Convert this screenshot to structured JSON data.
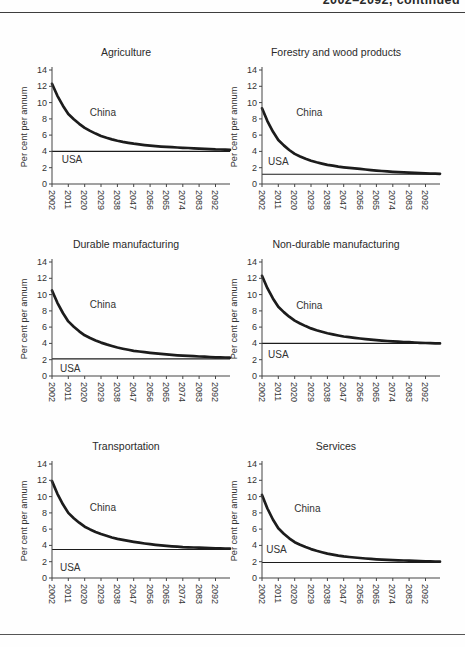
{
  "page": {
    "cropped_caption": "2002–2092, continued",
    "background": "#fefefe",
    "ink": "#1c1c1c",
    "text_color": "#333333",
    "rule_color": "#3e3e3e"
  },
  "axis": {
    "ylabel": "Per cent per annum",
    "y_ticks": [
      0,
      2,
      4,
      6,
      8,
      10,
      12,
      14
    ],
    "x_ticks": [
      2002,
      2011,
      2020,
      2029,
      2038,
      2047,
      2056,
      2065,
      2074,
      2083,
      2092
    ],
    "x_range": [
      2002,
      2100
    ],
    "y_range": [
      0,
      14
    ],
    "grid": false,
    "legend": "in-plot text labels"
  },
  "chart_data": [
    {
      "type": "line",
      "title": "Agriculture",
      "ylabel": "Per cent per annum",
      "ylim": [
        0,
        14
      ],
      "x": [
        2002,
        2011,
        2020,
        2029,
        2038,
        2047,
        2056,
        2065,
        2074,
        2083,
        2092,
        2100
      ],
      "series": [
        {
          "name": "China",
          "values": [
            12.3,
            8.6,
            6.9,
            5.9,
            5.3,
            4.95,
            4.7,
            4.55,
            4.45,
            4.35,
            4.25,
            4.2
          ]
        },
        {
          "name": "USA",
          "constant": 4.0
        }
      ],
      "china_label": {
        "x": 2030,
        "y": 8.7
      },
      "usa_label": {
        "x": 2013,
        "y": 3.0
      }
    },
    {
      "type": "line",
      "title": "Forestry and wood products",
      "ylabel": "Per cent per annum",
      "ylim": [
        0,
        14
      ],
      "x": [
        2002,
        2011,
        2020,
        2029,
        2038,
        2047,
        2056,
        2065,
        2074,
        2083,
        2092,
        2100
      ],
      "series": [
        {
          "name": "China",
          "values": [
            9.3,
            5.4,
            3.7,
            2.85,
            2.35,
            2.05,
            1.85,
            1.65,
            1.5,
            1.4,
            1.3,
            1.25
          ]
        },
        {
          "name": "USA",
          "constant": 1.2
        }
      ],
      "china_label": {
        "x": 2028,
        "y": 8.7
      },
      "usa_label": {
        "x": 2011,
        "y": 2.7
      }
    },
    {
      "type": "line",
      "title": "Durable manufacturing",
      "ylabel": "Per cent per annum",
      "ylim": [
        0,
        14
      ],
      "x": [
        2002,
        2011,
        2020,
        2029,
        2038,
        2047,
        2056,
        2065,
        2074,
        2083,
        2092,
        2100
      ],
      "series": [
        {
          "name": "China",
          "values": [
            10.5,
            6.7,
            5.0,
            4.1,
            3.5,
            3.1,
            2.85,
            2.65,
            2.5,
            2.4,
            2.3,
            2.25
          ]
        },
        {
          "name": "USA",
          "constant": 2.1
        }
      ],
      "china_label": {
        "x": 2030,
        "y": 8.7
      },
      "usa_label": {
        "x": 2012,
        "y": 0.9
      }
    },
    {
      "type": "line",
      "title": "Non-durable manufacturing",
      "ylabel": "Per cent per annum",
      "ylim": [
        0,
        14
      ],
      "x": [
        2002,
        2011,
        2020,
        2029,
        2038,
        2047,
        2056,
        2065,
        2074,
        2083,
        2092,
        2100
      ],
      "series": [
        {
          "name": "China",
          "values": [
            12.3,
            8.5,
            6.8,
            5.85,
            5.25,
            4.85,
            4.6,
            4.4,
            4.25,
            4.15,
            4.05,
            4.0
          ]
        },
        {
          "name": "USA",
          "constant": 4.0
        }
      ],
      "china_label": {
        "x": 2028,
        "y": 8.6
      },
      "usa_label": {
        "x": 2011,
        "y": 2.6
      }
    },
    {
      "type": "line",
      "title": "Transportation",
      "ylabel": "Per cent per annum",
      "ylim": [
        0,
        14
      ],
      "x": [
        2002,
        2011,
        2020,
        2029,
        2038,
        2047,
        2056,
        2065,
        2074,
        2083,
        2092,
        2100
      ],
      "series": [
        {
          "name": "China",
          "values": [
            11.9,
            8.0,
            6.3,
            5.4,
            4.8,
            4.45,
            4.15,
            3.95,
            3.8,
            3.72,
            3.65,
            3.6
          ]
        },
        {
          "name": "USA",
          "constant": 3.5
        }
      ],
      "china_label": {
        "x": 2030,
        "y": 8.6
      },
      "usa_label": {
        "x": 2012,
        "y": 1.2
      }
    },
    {
      "type": "line",
      "title": "Services",
      "ylabel": "Per cent per annum",
      "ylim": [
        0,
        14
      ],
      "x": [
        2002,
        2011,
        2020,
        2029,
        2038,
        2047,
        2056,
        2065,
        2074,
        2083,
        2092,
        2100
      ],
      "series": [
        {
          "name": "China",
          "values": [
            10.2,
            6.1,
            4.4,
            3.55,
            3.0,
            2.65,
            2.45,
            2.3,
            2.2,
            2.12,
            2.05,
            2.0
          ]
        },
        {
          "name": "USA",
          "constant": 1.9
        }
      ],
      "china_label": {
        "x": 2027,
        "y": 8.5
      },
      "usa_label": {
        "x": 2010,
        "y": 3.4
      }
    }
  ]
}
